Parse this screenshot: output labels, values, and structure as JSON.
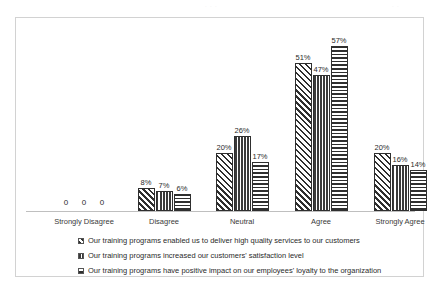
{
  "artifacts": {
    "left": "scan-mark",
    "right": "scan-mark"
  },
  "chart_data": {
    "type": "bar",
    "title": "",
    "subtitle": "",
    "xlabel": "",
    "ylabel": "",
    "ylim": [
      0,
      60
    ],
    "grid": false,
    "legend_position": "bottom",
    "categories": [
      "Strongly Disagree",
      "Disagree",
      "Neutral",
      "Agree",
      "Strongly Agree"
    ],
    "series": [
      {
        "name": "Our training programs  enabled us to deliver high quality services to our customers",
        "pattern": "diagonal-hatch",
        "values": [
          0,
          8,
          20,
          51,
          20
        ],
        "labels": [
          "0",
          "8%",
          "20%",
          "51%",
          "20%"
        ]
      },
      {
        "name": "Our training programs  increased our customers' satisfaction level",
        "pattern": "vertical-stripes",
        "values": [
          0,
          7,
          26,
          47,
          16
        ],
        "labels": [
          "0",
          "7%",
          "26%",
          "47%",
          "16%"
        ]
      },
      {
        "name": "Our training programs  have positive impact on our employees' loyalty to the organization",
        "pattern": "horizontal-stripes",
        "values": [
          0,
          6,
          17,
          57,
          14
        ],
        "labels": [
          "0",
          "6%",
          "17%",
          "57%",
          "14%"
        ]
      }
    ],
    "colors": {
      "bar_outline": "#2f2f2f",
      "axis": "#bfbfbf",
      "frame": "#d2d2d2",
      "text": "#2b2b2b",
      "background": "#ffffff"
    }
  }
}
